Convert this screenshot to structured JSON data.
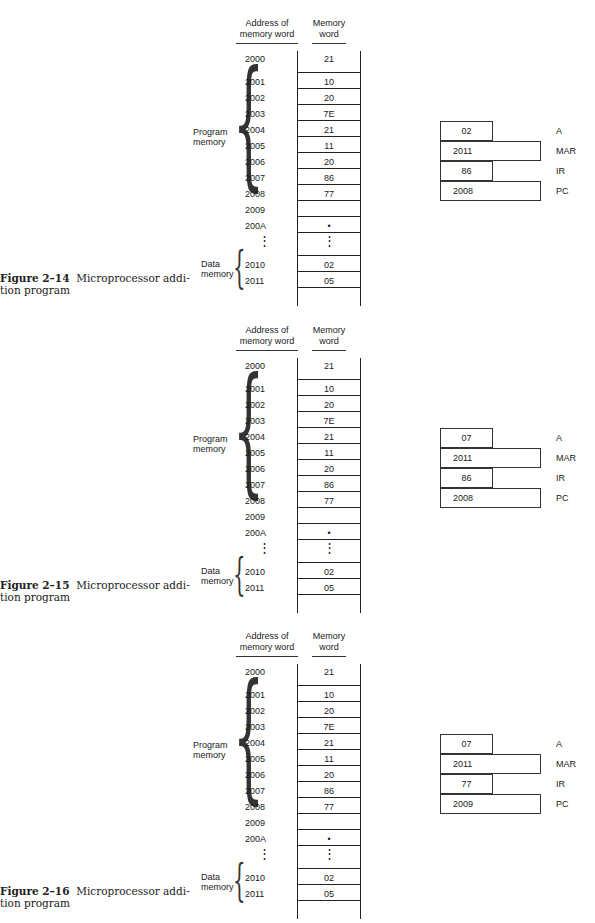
{
  "column_headers": {
    "address": "Address of memory word",
    "address_line1": "Address of",
    "address_line2": "memory word",
    "memory": "Memory word",
    "memory_line1": "Memory",
    "memory_line2": "word"
  },
  "group_labels": {
    "program_line1": "Program",
    "program_line2": "memory",
    "data_line1": "Data",
    "data_line2": "memory"
  },
  "figures": [
    {
      "number": "Figure 2–14",
      "caption_line1": "Microprocessor addi-",
      "caption_line2": "tion program",
      "memory": [
        {
          "address": "2000",
          "value": "21"
        },
        {
          "address": "2001",
          "value": "10"
        },
        {
          "address": "2002",
          "value": "20"
        },
        {
          "address": "2003",
          "value": "7E"
        },
        {
          "address": "2004",
          "value": "21"
        },
        {
          "address": "2005",
          "value": "11"
        },
        {
          "address": "2006",
          "value": "20"
        },
        {
          "address": "2007",
          "value": "86"
        },
        {
          "address": "2008",
          "value": "77"
        },
        {
          "address": "2009",
          "value": ""
        },
        {
          "address": "200A",
          "value": "•"
        },
        {
          "address": "⋮",
          "value": "⋮"
        },
        {
          "address": "2010",
          "value": "02"
        },
        {
          "address": "2011",
          "value": "05"
        }
      ],
      "registers": {
        "A": {
          "label": "A",
          "value": "02"
        },
        "MAR": {
          "label": "MAR",
          "value": "2011"
        },
        "IR": {
          "label": "IR",
          "value": "86"
        },
        "PC": {
          "label": "PC",
          "value": "2008"
        }
      }
    },
    {
      "number": "Figure 2–15",
      "caption_line1": "Microprocessor addi-",
      "caption_line2": "tion program",
      "memory": [
        {
          "address": "2000",
          "value": "21"
        },
        {
          "address": "2001",
          "value": "10"
        },
        {
          "address": "2002",
          "value": "20"
        },
        {
          "address": "2003",
          "value": "7E"
        },
        {
          "address": "2004",
          "value": "21"
        },
        {
          "address": "2005",
          "value": "11"
        },
        {
          "address": "2006",
          "value": "20"
        },
        {
          "address": "2007",
          "value": "86"
        },
        {
          "address": "2008",
          "value": "77"
        },
        {
          "address": "2009",
          "value": ""
        },
        {
          "address": "200A",
          "value": "•"
        },
        {
          "address": "⋮",
          "value": "⋮"
        },
        {
          "address": "2010",
          "value": "02"
        },
        {
          "address": "2011",
          "value": "05"
        }
      ],
      "registers": {
        "A": {
          "label": "A",
          "value": "07"
        },
        "MAR": {
          "label": "MAR",
          "value": "2011"
        },
        "IR": {
          "label": "IR",
          "value": "86"
        },
        "PC": {
          "label": "PC",
          "value": "2008"
        }
      }
    },
    {
      "number": "Figure 2–16",
      "caption_line1": "Microprocessor addi-",
      "caption_line2": "tion program",
      "memory": [
        {
          "address": "2000",
          "value": "21"
        },
        {
          "address": "2001",
          "value": "10"
        },
        {
          "address": "2002",
          "value": "20"
        },
        {
          "address": "2003",
          "value": "7E"
        },
        {
          "address": "2004",
          "value": "21"
        },
        {
          "address": "2005",
          "value": "11"
        },
        {
          "address": "2006",
          "value": "20"
        },
        {
          "address": "2007",
          "value": "86"
        },
        {
          "address": "2008",
          "value": "77"
        },
        {
          "address": "2009",
          "value": ""
        },
        {
          "address": "200A",
          "value": "•"
        },
        {
          "address": "⋮",
          "value": "⋮"
        },
        {
          "address": "2010",
          "value": "02"
        },
        {
          "address": "2011",
          "value": "05"
        }
      ],
      "registers": {
        "A": {
          "label": "A",
          "value": "07"
        },
        "MAR": {
          "label": "MAR",
          "value": "2011"
        },
        "IR": {
          "label": "IR",
          "value": "77"
        },
        "PC": {
          "label": "PC",
          "value": "2009"
        }
      }
    }
  ]
}
